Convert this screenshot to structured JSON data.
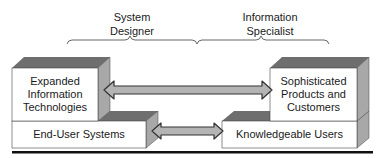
{
  "roles": {
    "left": "System Designer",
    "left_lines": [
      "System",
      "Designer"
    ],
    "right": "Information Specialist",
    "right_lines": [
      "Information",
      "Specialist"
    ]
  },
  "boxes": {
    "top_left": {
      "lines": [
        "Expanded",
        "Information",
        "Technologies"
      ]
    },
    "bottom_left": {
      "lines": [
        "End-User Systems"
      ]
    },
    "top_right": {
      "lines": [
        "Sophisticated",
        "Products and",
        "Customers"
      ]
    },
    "bottom_right": {
      "lines": [
        "Knowledgeable Users"
      ]
    }
  },
  "colors": {
    "front": "#ffffff",
    "top_face": "#6e6e6e",
    "side_face": "#a8a8a8",
    "arrow_fill": "#b4b4b4",
    "arrow_stroke": "#333333",
    "rule": "#111111"
  }
}
